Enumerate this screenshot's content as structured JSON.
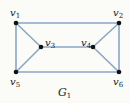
{
  "graph": {
    "name": "G",
    "name_sub": "1",
    "edge_color": "#8aa6c8",
    "vertex_color": "#111111",
    "vertices": [
      {
        "id": "v1",
        "base": "v",
        "sub": "1",
        "x": 16,
        "y": 23,
        "lx": 10,
        "ly": 16
      },
      {
        "id": "v2",
        "base": "v",
        "sub": "2",
        "x": 119,
        "y": 23,
        "lx": 113,
        "ly": 16
      },
      {
        "id": "v3",
        "base": "v",
        "sub": "3",
        "x": 41,
        "y": 47,
        "lx": 45,
        "ly": 46
      },
      {
        "id": "v4",
        "base": "v",
        "sub": "4",
        "x": 93,
        "y": 47,
        "lx": 81,
        "ly": 46
      },
      {
        "id": "v5",
        "base": "v",
        "sub": "5",
        "x": 16,
        "y": 72,
        "lx": 10,
        "ly": 85
      },
      {
        "id": "v6",
        "base": "v",
        "sub": "6",
        "x": 119,
        "y": 72,
        "lx": 113,
        "ly": 85
      }
    ],
    "edges": [
      [
        "v1",
        "v2"
      ],
      [
        "v1",
        "v5"
      ],
      [
        "v1",
        "v3"
      ],
      [
        "v2",
        "v6"
      ],
      [
        "v2",
        "v4"
      ],
      [
        "v3",
        "v4"
      ],
      [
        "v3",
        "v5"
      ],
      [
        "v4",
        "v6"
      ],
      [
        "v5",
        "v6"
      ]
    ]
  }
}
